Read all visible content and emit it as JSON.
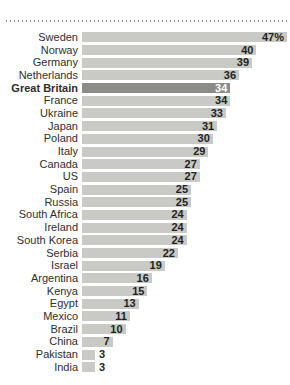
{
  "chart_data": {
    "type": "bar",
    "orientation": "horizontal",
    "title": "",
    "xlabel": "",
    "ylabel": "",
    "xlim": [
      0,
      47
    ],
    "grid": false,
    "legend": null,
    "categories": [
      "Sweden",
      "Norway",
      "Germany",
      "Netherlands",
      "Great Britain",
      "France",
      "Ukraine",
      "Japan",
      "Poland",
      "Italy",
      "Canada",
      "US",
      "Spain",
      "Russia",
      "South Africa",
      "Ireland",
      "South Korea",
      "Serbia",
      "Israel",
      "Argentina",
      "Kenya",
      "Egypt",
      "Mexico",
      "Brazil",
      "China",
      "Pakistan",
      "India"
    ],
    "values": [
      47,
      40,
      39,
      36,
      34,
      34,
      33,
      31,
      30,
      29,
      27,
      27,
      25,
      25,
      24,
      24,
      24,
      22,
      19,
      16,
      15,
      13,
      11,
      10,
      7,
      3,
      3
    ],
    "value_labels": [
      "47%",
      "40",
      "39",
      "36",
      "34",
      "34",
      "33",
      "31",
      "30",
      "29",
      "27",
      "27",
      "25",
      "25",
      "24",
      "24",
      "24",
      "22",
      "19",
      "16",
      "15",
      "13",
      "11",
      "10",
      "7",
      "3",
      "3"
    ],
    "highlight_category": "Great Britain",
    "highlight_index": 4,
    "value_label_placement": "inside bar end; outside for smallest bars"
  },
  "decorations": {
    "top_divider_style": "dotted"
  },
  "colors": {
    "background": "#ffffff",
    "bar": "#c9c9c5",
    "bar_highlight": "#8b8b88",
    "label_text": "#2e2e2e",
    "value_text": "#1f1f1f",
    "value_text_highlight": "#ffffff",
    "divider": "#8f8f8f"
  }
}
